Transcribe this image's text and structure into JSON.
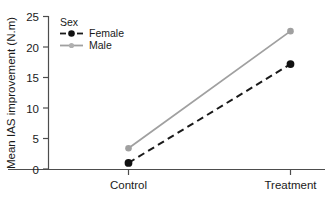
{
  "chart_data": {
    "type": "line",
    "title": "",
    "subtitle": "",
    "xlabel": "",
    "ylabel": "Mean IAS improvement (N.m)",
    "categories": [
      "Control",
      "Treatment"
    ],
    "series": [
      {
        "name": "Female",
        "values": [
          1.0,
          17.2
        ],
        "color": "#1a1a1a",
        "linestyle": "dashed",
        "marker": "filled-circle"
      },
      {
        "name": "Male",
        "values": [
          3.4,
          22.6
        ],
        "color": "#a0a0a0",
        "linestyle": "solid",
        "marker": "filled-circle"
      }
    ],
    "ylim": [
      0,
      25
    ],
    "yticks": [
      0,
      5,
      10,
      15,
      20,
      25
    ],
    "ytick_labels": [
      "0",
      "5",
      "10",
      "15",
      "20",
      "25"
    ],
    "xtick_labels": [
      "Control",
      "Treatment"
    ],
    "grid": false,
    "legend": {
      "title": "Sex",
      "position": "top-left-inside",
      "entries": [
        "Female",
        "Male"
      ]
    },
    "annotations": []
  },
  "axis": {
    "y_title": "Mean IAS improvement (N.m)",
    "y_ticks": [
      "25",
      "20",
      "15",
      "10",
      "5",
      "0"
    ],
    "x_ticks": [
      "Control",
      "Treatment"
    ]
  },
  "legend": {
    "title": "Sex",
    "female_label": "Female",
    "male_label": "Male"
  },
  "colors": {
    "female": "#1a1a1a",
    "male": "#a0a0a0",
    "axis": "#4d4d4d",
    "text": "#1a1a1a",
    "background": "#ffffff"
  }
}
